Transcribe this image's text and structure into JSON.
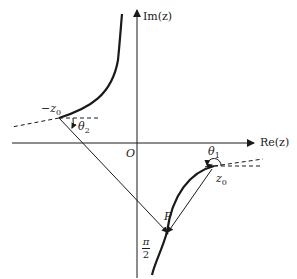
{
  "diagram": {
    "axes": {
      "x_label": "Re(z)",
      "y_label": "Im(z)",
      "origin_label": "O"
    },
    "points": {
      "neg_z0": {
        "name": "−z",
        "sub": "0"
      },
      "z0": {
        "name": "z",
        "sub": "0"
      },
      "P": {
        "name": "P"
      }
    },
    "angles": {
      "theta1": {
        "name": "θ",
        "sub": "1"
      },
      "theta2": {
        "name": "θ",
        "sub": "2"
      }
    },
    "annotation": {
      "numerator": "π",
      "denominator": "2"
    },
    "colors": {
      "stroke": "#1a1a1a",
      "background": "#ffffff"
    }
  }
}
